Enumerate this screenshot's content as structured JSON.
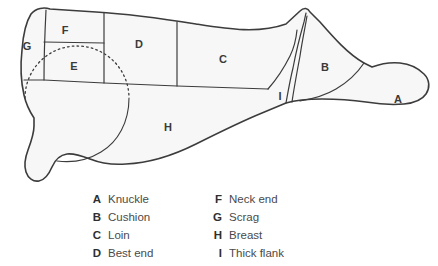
{
  "diagram": {
    "fill_color": "#f7f7f7",
    "stroke_color": "#3c3c3c",
    "dotted_color": "#3c3c3c",
    "regions": [
      {
        "key": "A",
        "name": "Knuckle",
        "label_x": 398,
        "label_y": 100
      },
      {
        "key": "B",
        "name": "Cushion",
        "label_x": 325,
        "label_y": 68
      },
      {
        "key": "C",
        "name": "Loin",
        "label_x": 223,
        "label_y": 60
      },
      {
        "key": "D",
        "name": "Best end",
        "label_x": 139,
        "label_y": 45
      },
      {
        "key": "E",
        "name": "",
        "label_x": 74,
        "label_y": 67
      },
      {
        "key": "F",
        "name": "Neck end",
        "label_x": 65,
        "label_y": 31
      },
      {
        "key": "G",
        "name": "Scrag",
        "label_x": 27,
        "label_y": 47
      },
      {
        "key": "H",
        "name": "Breast",
        "label_x": 168,
        "label_y": 128
      },
      {
        "key": "I",
        "name": "Thick flank",
        "label_x": 280,
        "label_y": 97
      }
    ]
  },
  "legend": {
    "left_column": [
      {
        "key": "A",
        "name": "Knuckle"
      },
      {
        "key": "B",
        "name": "Cushion"
      },
      {
        "key": "C",
        "name": "Loin"
      },
      {
        "key": "D",
        "name": "Best end"
      }
    ],
    "right_column": [
      {
        "key": "F",
        "name": "Neck end"
      },
      {
        "key": "G",
        "name": "Scrag"
      },
      {
        "key": "H",
        "name": "Breast"
      },
      {
        "key": "I",
        "name": "Thick flank"
      }
    ]
  }
}
